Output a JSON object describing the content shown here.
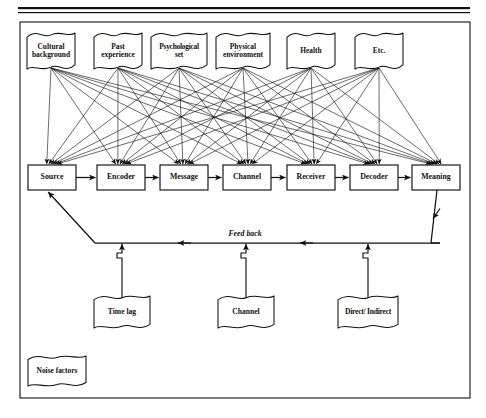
{
  "figure": {
    "type": "communication-process-model",
    "background_color": "#ffffff",
    "ink_color": "#111111",
    "frame": {
      "x": 20,
      "y": 22,
      "width": 450,
      "height": 376
    },
    "top_rules": [
      {
        "y": 7,
        "thickness": 2.2
      },
      {
        "y": 12,
        "thickness": 1.2
      }
    ]
  },
  "influence_banners": {
    "label": "Influencing factors",
    "items": [
      {
        "text": "Cultural\nbackground",
        "x": 27,
        "y": 33,
        "width": 48,
        "height": 36
      },
      {
        "text": "Past\nexperience",
        "x": 94,
        "y": 33,
        "width": 48,
        "height": 36
      },
      {
        "text": "Psychological\nset",
        "x": 151,
        "y": 33,
        "width": 56,
        "height": 36
      },
      {
        "text": "Physical\nenvironment",
        "x": 216,
        "y": 33,
        "width": 54,
        "height": 36
      },
      {
        "text": "Health",
        "x": 287,
        "y": 33,
        "width": 48,
        "height": 36
      },
      {
        "text": "Etc.",
        "x": 355,
        "y": 33,
        "width": 48,
        "height": 36
      }
    ]
  },
  "process_chain": {
    "label": "Linear communication chain",
    "items": [
      {
        "text": "Source",
        "x": 28,
        "y": 165,
        "width": 48,
        "height": 25
      },
      {
        "text": "Encoder",
        "x": 97,
        "y": 165,
        "width": 48,
        "height": 25
      },
      {
        "text": "Message",
        "x": 160,
        "y": 165,
        "width": 48,
        "height": 25
      },
      {
        "text": "Channel",
        "x": 223,
        "y": 165,
        "width": 48,
        "height": 25
      },
      {
        "text": "Receiver",
        "x": 287,
        "y": 165,
        "width": 48,
        "height": 25
      },
      {
        "text": "Decoder",
        "x": 350,
        "y": 165,
        "width": 48,
        "height": 25
      },
      {
        "text": "Meaning",
        "x": 412,
        "y": 165,
        "width": 48,
        "height": 25
      }
    ]
  },
  "feedback": {
    "label_text": "Feed back",
    "label_x": 245,
    "label_y": 236,
    "line_y": 243,
    "line_left_x": 95,
    "line_right_x": 440
  },
  "feedback_attributes": {
    "label": "Feedback attributes",
    "items": [
      {
        "text": "Time lag",
        "x": 94,
        "y": 296,
        "width": 56,
        "height": 32,
        "connector_x": 122
      },
      {
        "text": "Channel",
        "x": 218,
        "y": 296,
        "width": 56,
        "height": 32,
        "connector_x": 246
      },
      {
        "text": "Direct/ Indirect",
        "x": 338,
        "y": 296,
        "width": 60,
        "height": 32,
        "connector_x": 368
      }
    ]
  },
  "noise": {
    "text": "Noise factors",
    "x": 28,
    "y": 356,
    "width": 58,
    "height": 30
  }
}
